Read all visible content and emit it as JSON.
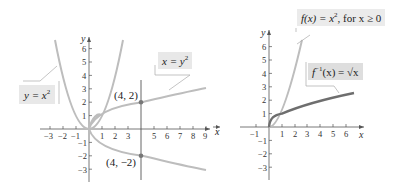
{
  "left_graph": {
    "x_axis_label": "x",
    "y_axis_label": "y",
    "x_ticks": [
      "−3",
      "−2",
      "−1",
      "1",
      "2",
      "3",
      "5",
      "6",
      "7",
      "8",
      "9"
    ],
    "y_ticks": [
      "6",
      "5",
      "4",
      "3",
      "2",
      "1",
      "−1",
      "−2",
      "−3"
    ],
    "curves": [
      {
        "name": "parabola",
        "label": "y = x²"
      },
      {
        "name": "sideways-parabola",
        "label": "x = y²"
      }
    ],
    "points": [
      {
        "label": "(4, 2)",
        "x": 4,
        "y": 2
      },
      {
        "label": "(4, −2)",
        "x": 4,
        "y": -2
      }
    ],
    "vertical_line_x": 4,
    "colors": {
      "curve": "#bdbdbd",
      "axis": "#555555",
      "line": "#555555"
    }
  },
  "right_graph": {
    "x_axis_label": "x",
    "y_axis_label": "y",
    "x_ticks": [
      "−1",
      "1",
      "2",
      "3",
      "4",
      "5",
      "6"
    ],
    "y_ticks": [
      "6",
      "5",
      "4",
      "3",
      "2",
      "1",
      "−1",
      "−2",
      "−3"
    ],
    "curves": [
      {
        "name": "f",
        "label": "f(x) = x², for x ≥ 0"
      },
      {
        "name": "f-inverse",
        "label": "f⁻¹(x) = √x"
      }
    ],
    "colors": {
      "f": "#bdbdbd",
      "f_inverse": "#6e6e6e",
      "axis": "#555555"
    }
  },
  "labels": {
    "y_eq_x2": "y = x",
    "y_eq_x2_sup": "2",
    "x_eq_y2": "x = y",
    "x_eq_y2_sup": "2",
    "pt_upper": "(4, 2)",
    "pt_lower": "(4, −2)",
    "f_label_a": "f(x) = x",
    "f_label_sup": "2",
    "f_label_b": ", for x ≥ 0",
    "finv_label_a": "f",
    "finv_label_sup": "−1",
    "finv_label_b": "(x) = √x",
    "stray_x": "x"
  }
}
